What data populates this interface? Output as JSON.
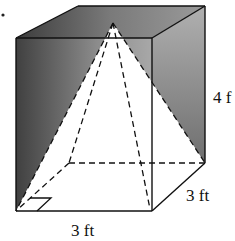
{
  "figure": {
    "labels": {
      "height": "4 f",
      "depth": "3 ft",
      "width": "3 ft"
    },
    "colors": {
      "shade_dark": "#3a3a3a",
      "shade_mid": "#8a8a8a",
      "shade_light": "#bdbdbd",
      "line": "#111111",
      "background": "#ffffff"
    }
  }
}
